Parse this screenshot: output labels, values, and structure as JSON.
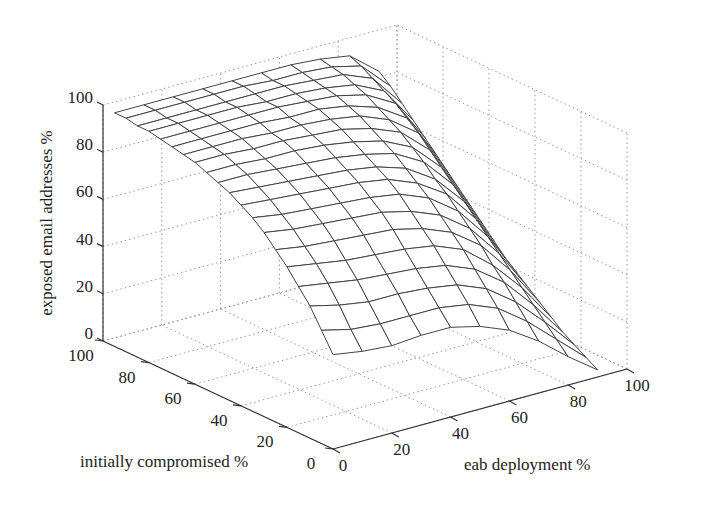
{
  "chart_data": {
    "type": "surface",
    "title": "",
    "xlabel": "eab deployment %",
    "ylabel": "initially compromised %",
    "zlabel": "exposed email addresses %",
    "x_ticks": [
      "0",
      "20",
      "40",
      "60",
      "80",
      "100"
    ],
    "y_ticks": [
      "0",
      "20",
      "40",
      "60",
      "80",
      "100"
    ],
    "z_ticks": [
      "0",
      "20",
      "40",
      "60",
      "80",
      "100"
    ],
    "xlim": [
      0,
      100
    ],
    "ylim": [
      0,
      100
    ],
    "zlim": [
      0,
      100
    ],
    "grid": true,
    "x": [
      0,
      10,
      20,
      30,
      40,
      50,
      60,
      70,
      80,
      90
    ],
    "y": [
      0,
      5,
      10,
      15,
      20,
      25,
      30,
      35,
      40,
      45,
      50,
      55,
      60,
      65,
      70,
      75,
      80,
      85,
      90,
      95
    ],
    "z": [
      [
        40,
        38,
        37,
        38,
        38,
        35,
        30,
        22,
        12,
        3
      ],
      [
        48,
        45,
        44,
        44,
        44,
        42,
        37,
        28,
        17,
        6
      ],
      [
        56,
        53,
        51,
        51,
        50,
        48,
        43,
        34,
        22,
        9
      ],
      [
        62,
        60,
        58,
        57,
        56,
        54,
        49,
        40,
        27,
        12
      ],
      [
        68,
        66,
        64,
        63,
        62,
        60,
        55,
        45,
        32,
        16
      ],
      [
        73,
        71,
        70,
        69,
        68,
        65,
        60,
        51,
        37,
        20
      ],
      [
        78,
        76,
        75,
        74,
        73,
        70,
        65,
        56,
        42,
        24
      ],
      [
        82,
        80,
        79,
        78,
        77,
        75,
        70,
        61,
        47,
        28
      ],
      [
        85,
        84,
        83,
        82,
        81,
        79,
        74,
        66,
        52,
        32
      ],
      [
        88,
        87,
        86,
        85,
        84,
        82,
        78,
        70,
        57,
        37
      ],
      [
        90,
        90,
        89,
        88,
        87,
        85,
        82,
        75,
        62,
        42
      ],
      [
        92,
        92,
        91,
        91,
        90,
        88,
        85,
        79,
        67,
        47
      ],
      [
        94,
        94,
        93,
        93,
        92,
        91,
        88,
        83,
        72,
        52
      ],
      [
        95,
        95,
        95,
        94,
        94,
        93,
        91,
        86,
        77,
        57
      ],
      [
        96,
        96,
        96,
        96,
        95,
        95,
        93,
        89,
        81,
        62
      ],
      [
        97,
        97,
        97,
        97,
        97,
        96,
        95,
        92,
        85,
        67
      ],
      [
        98,
        98,
        98,
        98,
        97,
        97,
        96,
        94,
        88,
        72
      ],
      [
        98,
        98,
        98,
        98,
        98,
        98,
        97,
        96,
        91,
        77
      ],
      [
        99,
        99,
        99,
        99,
        99,
        98,
        98,
        97,
        94,
        82
      ],
      [
        99,
        99,
        99,
        99,
        99,
        99,
        99,
        98,
        96,
        86
      ]
    ],
    "projection": {
      "origin_px": [
        333,
        449
      ],
      "x_unit_px": [
        2.94,
        -0.8
      ],
      "y_unit_px": [
        -2.3,
        -1.08
      ],
      "z_unit_px": [
        0,
        -2.36
      ]
    }
  }
}
